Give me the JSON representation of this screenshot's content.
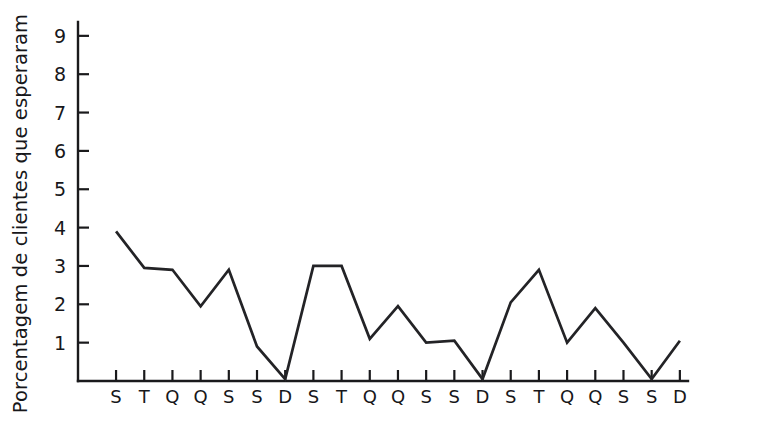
{
  "chart_data": {
    "type": "line",
    "title": "",
    "subtitle": "",
    "xlabel": "",
    "ylabel": "Porcentagem de clientes que esperaram",
    "categories": [
      "S",
      "T",
      "Q",
      "Q",
      "S",
      "S",
      "D",
      "S",
      "T",
      "Q",
      "Q",
      "S",
      "S",
      "D",
      "S",
      "T",
      "Q",
      "Q",
      "S",
      "S",
      "D"
    ],
    "values": [
      3.9,
      2.95,
      2.9,
      1.95,
      2.9,
      0.9,
      0.05,
      3.0,
      3.0,
      1.1,
      1.95,
      1.0,
      1.05,
      0.05,
      2.05,
      2.9,
      1.0,
      1.9,
      1.0,
      0.05,
      1.05
    ],
    "series": [
      {
        "name": "Porcentagem de clientes que esperaram",
        "values": [
          3.9,
          2.95,
          2.9,
          1.95,
          2.9,
          0.9,
          0.05,
          3.0,
          3.0,
          1.1,
          1.95,
          1.0,
          1.05,
          0.05,
          2.05,
          2.9,
          1.0,
          1.9,
          1.0,
          0.05,
          1.05
        ]
      }
    ],
    "ylim": [
      0,
      9.6
    ],
    "xlim": [
      0,
      21
    ],
    "ytick_labels": [
      "1",
      "2",
      "3",
      "4",
      "5",
      "6",
      "7",
      "8",
      "9"
    ],
    "ytick_values": [
      1,
      2,
      3,
      4,
      5,
      6,
      7,
      8,
      9
    ],
    "grid": false,
    "legend": false,
    "legend_position": "none",
    "line_color": "#232326",
    "axis_color": "#1a1a1c",
    "background_color": "#ffffff"
  },
  "axes": {
    "y_label_text": "Porcentagem de clientes que esperaram"
  }
}
